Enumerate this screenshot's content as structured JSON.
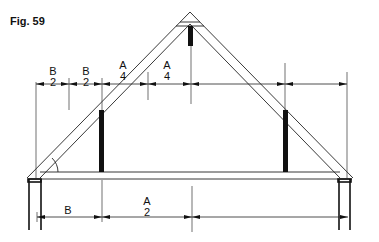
{
  "figure": {
    "label": "Fig. 59"
  },
  "top_dimensions": [
    {
      "letter": "B",
      "divisor": "2"
    },
    {
      "letter": "B",
      "divisor": "2"
    },
    {
      "letter": "A",
      "divisor": "4"
    },
    {
      "letter": "A",
      "divisor": "4"
    }
  ],
  "bottom_dimensions": [
    {
      "letter": "B",
      "divisor": ""
    },
    {
      "letter": "A",
      "divisor": "2"
    }
  ],
  "colors": {
    "line": "#222222",
    "post": "#111111",
    "background": "#ffffff"
  }
}
